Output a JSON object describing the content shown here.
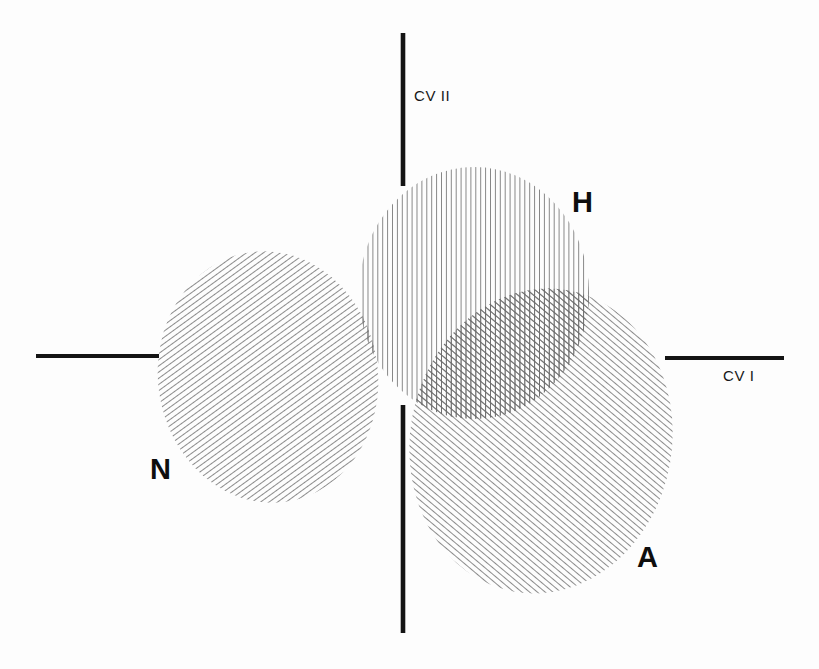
{
  "figure": {
    "background_color": "#fdfdfd",
    "ink_color": "#141414",
    "hatch_color": "#5a5a5a",
    "width": 819,
    "height": 669
  },
  "axes": {
    "horizontal": {
      "label": "CV I",
      "name": "canonical-variate-1",
      "label_x": 723,
      "label_y": 381,
      "left_segment": {
        "x1": 36,
        "y1": 356,
        "x2": 159,
        "y2": 356
      },
      "right_segment": {
        "x1": 665,
        "y1": 358,
        "x2": 784,
        "y2": 358
      },
      "stroke_width": 4.2
    },
    "vertical": {
      "label": "CV II",
      "name": "canonical-variate-2",
      "label_x": 414,
      "label_y": 101,
      "top_segment": {
        "x1": 403,
        "y1": 33,
        "x2": 403,
        "y2": 186
      },
      "bottom_segment": {
        "x1": 403,
        "y1": 405,
        "x2": 403,
        "y2": 633
      },
      "stroke_width": 4.6
    }
  },
  "chart_data": {
    "type": "scatter",
    "title": "",
    "xlabel": "CV I",
    "ylabel": "CV II",
    "grid": false,
    "legend": "inline-labels",
    "groups": [
      {
        "label": "N",
        "name": "ellipse-n",
        "hatch": "diagonal-backslash",
        "hatch_angle_deg": 62,
        "hatch_spacing": 4.6,
        "cx": 268,
        "cy": 377,
        "rx": 110,
        "ry": 126,
        "rotation_deg": -8,
        "label_x": 150,
        "label_y": 479
      },
      {
        "label": "H",
        "name": "ellipse-h",
        "hatch": "vertical",
        "hatch_angle_deg": 90,
        "hatch_spacing": 4.6,
        "cx": 474,
        "cy": 293,
        "rx": 115,
        "ry": 126,
        "rotation_deg": 0,
        "label_x": 572,
        "label_y": 212
      },
      {
        "label": "A",
        "name": "ellipse-a",
        "hatch": "diagonal-forwardslash",
        "hatch_angle_deg": -60,
        "hatch_spacing": 4.6,
        "cx": 541,
        "cy": 441,
        "rx": 131,
        "ry": 153,
        "rotation_deg": 10,
        "label_x": 637,
        "label_y": 567
      }
    ],
    "overlaps": [
      {
        "name": "overlap-n-h",
        "groups": [
          "N",
          "H"
        ],
        "pattern": "crosshatch-backslash-vertical"
      },
      {
        "name": "overlap-h-a",
        "groups": [
          "H",
          "A"
        ],
        "pattern": "crosshatch-vertical-forwardslash"
      },
      {
        "name": "overlap-n-a",
        "groups": [
          "N",
          "A"
        ],
        "pattern": "crosshatch-backslash-forwardslash"
      }
    ]
  }
}
